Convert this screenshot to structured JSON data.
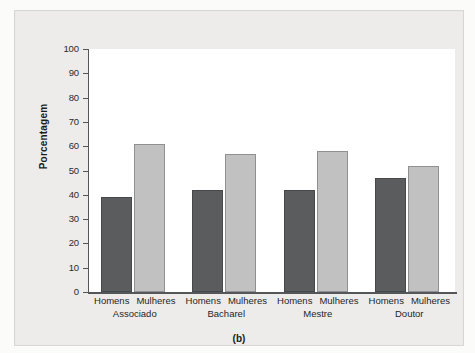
{
  "figure": {
    "panel_label": "(b)",
    "colors": {
      "men_bar": "#5b5c5e",
      "women_bar": "#c0c1c0",
      "axis": "#55565a",
      "plate_background": "#edecea",
      "plot_background": "#ffffff"
    }
  },
  "chart_data": {
    "type": "bar",
    "title": "",
    "subtitle": "",
    "xlabel": "",
    "ylabel": "Porcentagem",
    "ylim": [
      0,
      100
    ],
    "yticks": [
      0,
      10,
      20,
      30,
      40,
      50,
      60,
      70,
      80,
      90,
      100
    ],
    "ytick_labels": [
      "0",
      "10",
      "20",
      "30",
      "40",
      "50",
      "60",
      "70",
      "80",
      "90",
      "100"
    ],
    "grid": false,
    "legend": "none",
    "categories": [
      "Associado",
      "Bacharel",
      "Mestre",
      "Doutor"
    ],
    "series": [
      {
        "name": "Homens",
        "values": [
          39,
          42,
          42,
          47
        ]
      },
      {
        "name": "Mulheres",
        "values": [
          61,
          57,
          58,
          52
        ]
      }
    ],
    "group_labels": [
      {
        "category": "Associado",
        "bars": [
          {
            "series": "Homens",
            "value": 39
          },
          {
            "series": "Mulheres",
            "value": 61
          }
        ]
      },
      {
        "category": "Bacharel",
        "bars": [
          {
            "series": "Homens",
            "value": 42
          },
          {
            "series": "Mulheres",
            "value": 57
          }
        ]
      },
      {
        "category": "Mestre",
        "bars": [
          {
            "series": "Homens",
            "value": 42
          },
          {
            "series": "Mulheres",
            "value": 58
          }
        ]
      },
      {
        "category": "Doutor",
        "bars": [
          {
            "series": "Homens",
            "value": 47
          },
          {
            "series": "Mulheres",
            "value": 52
          }
        ]
      }
    ],
    "annotations": [
      "(b)"
    ]
  }
}
